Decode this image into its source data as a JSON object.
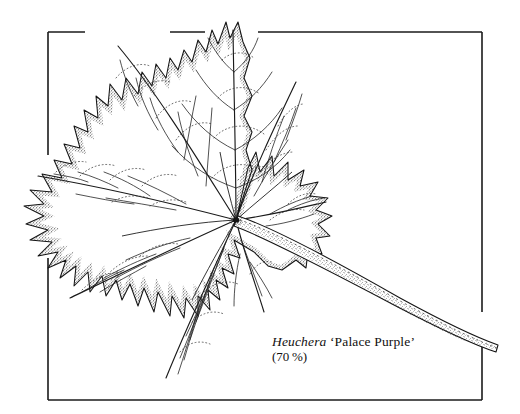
{
  "plate": {
    "kind": "botanical-line-drawing",
    "subject": "palmately lobed leaf with petiole",
    "background_color": "#ffffff",
    "ink_color": "#111111"
  },
  "caption": {
    "genus": "Heuchera",
    "cultivar": "‘Palace Purple’",
    "scale": "(70 %)"
  },
  "frame": {
    "left": 48,
    "top": 32,
    "right": 482,
    "bottom": 400,
    "stroke_width": 1.6,
    "color": "#1a1a1a",
    "top_gaps": [
      [
        85,
        170
      ],
      [
        205,
        258
      ]
    ],
    "left_gaps": [
      [
        155,
        258
      ]
    ],
    "right_gaps": [
      [
        312,
        344
      ]
    ]
  },
  "leaf": {
    "center_x": 236,
    "center_y": 220,
    "lobe_count": 7,
    "margin": "dentate-serrate",
    "bounds": {
      "left": 22,
      "top": 18,
      "right": 332,
      "bottom": 383
    },
    "lobes": [
      {
        "name": "lobe-apical",
        "tip_x": 232,
        "tip_y": 20
      },
      {
        "name": "lobe-upper-left",
        "tip_x": 108,
        "tip_y": 40
      },
      {
        "name": "lobe-upper-right",
        "tip_x": 300,
        "tip_y": 74
      },
      {
        "name": "lobe-mid-left",
        "tip_x": 30,
        "tip_y": 172
      },
      {
        "name": "lobe-mid-right",
        "tip_x": 330,
        "tip_y": 198
      },
      {
        "name": "lobe-lower-left",
        "tip_x": 62,
        "tip_y": 300
      },
      {
        "name": "lobe-lower-right",
        "tip_x": 268,
        "tip_y": 318
      },
      {
        "name": "lobe-basal",
        "tip_x": 160,
        "tip_y": 381
      }
    ]
  },
  "petiole": {
    "start_x": 240,
    "start_y": 222,
    "end_x": 498,
    "end_y": 342,
    "description": "stem curving down to the right past the frame"
  }
}
